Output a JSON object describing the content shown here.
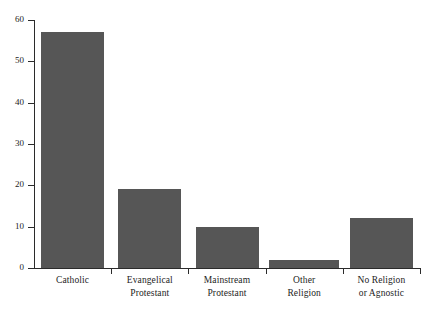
{
  "chart_data": {
    "type": "bar",
    "title": "",
    "subtitle": "",
    "xlabel": "",
    "ylabel": "",
    "categories": [
      "Catholic",
      "Evangelical Protestant",
      "Mainstream Protestant",
      "Other Religion",
      "No Religion or Agnostic"
    ],
    "category_lines": [
      [
        "Catholic",
        ""
      ],
      [
        "Evangelical",
        "Protestant"
      ],
      [
        "Mainstream",
        "Protestant"
      ],
      [
        "Other",
        "Religion"
      ],
      [
        "No Religion",
        "or Agnostic"
      ]
    ],
    "values": [
      57,
      19,
      10,
      2,
      12
    ],
    "ylim": [
      0,
      60
    ],
    "yticks": [
      0,
      10,
      20,
      30,
      40,
      50,
      60
    ],
    "ytick_labels": [
      "0",
      "10",
      "20",
      "30",
      "40",
      "50",
      "60"
    ],
    "grid": false,
    "legend": null,
    "bar_color": "#565656",
    "axis_color": "#2b2b2b",
    "background_color": "#ffffff"
  }
}
